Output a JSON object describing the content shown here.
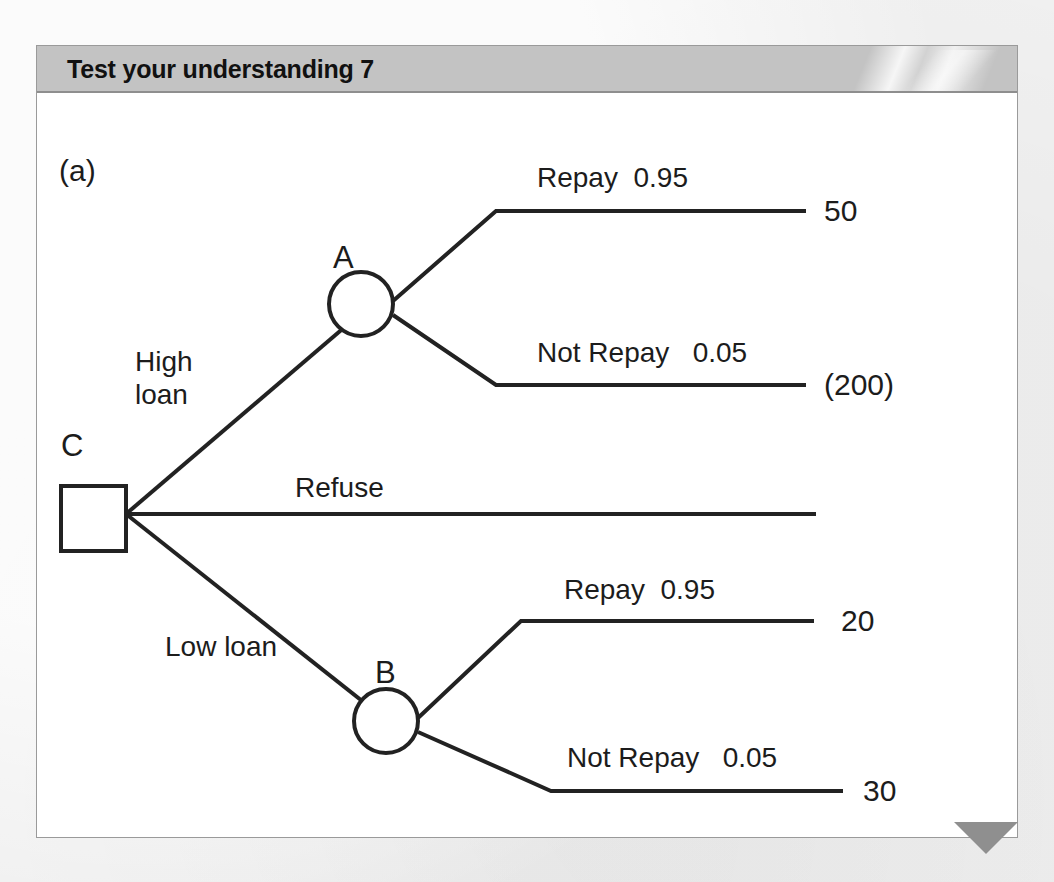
{
  "header": {
    "title": "Test your understanding 7"
  },
  "diagram": {
    "part_label": "(a)",
    "type": "decision-tree",
    "nodes": [
      {
        "id": "C",
        "label": "C",
        "shape": "square",
        "kind": "decision"
      },
      {
        "id": "A",
        "label": "A",
        "shape": "circle",
        "kind": "chance"
      },
      {
        "id": "B",
        "label": "B",
        "shape": "circle",
        "kind": "chance"
      }
    ],
    "branches": {
      "high_loan": "High\nloan",
      "refuse": "Refuse",
      "low_loan": "Low loan",
      "a_repay": "Repay  0.95",
      "a_not_repay": "Not Repay   0.05",
      "b_repay": "Repay  0.95",
      "b_not_repay": "Not Repay   0.05"
    },
    "payoffs": {
      "a_repay": "50",
      "a_not_repay": "(200)",
      "refuse": "",
      "b_repay": "20",
      "b_not_repay": "30"
    },
    "colors": {
      "stroke": "#222222",
      "panel": "#ffffff",
      "header": "#c3c3c3",
      "accent": "#8f8f8f"
    }
  }
}
